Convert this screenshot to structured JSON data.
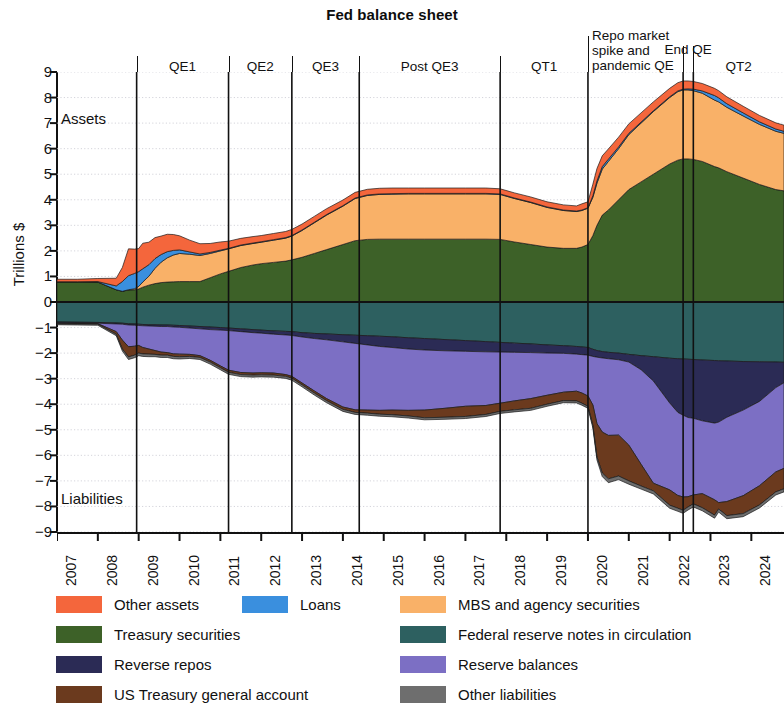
{
  "chart_data": {
    "type": "area",
    "title": "Fed balance sheet",
    "xlabel": "",
    "ylabel": "Trillions $",
    "ylim": [
      -9,
      9
    ],
    "xlim": [
      2007,
      2024.8
    ],
    "grid": true,
    "legend_position": "bottom",
    "y_ticks": [
      "9",
      "8",
      "7",
      "6",
      "5",
      "4",
      "3",
      "2",
      "1",
      "0",
      "−1",
      "−2",
      "−3",
      "−4",
      "−5",
      "−6",
      "−7",
      "−8",
      "−9"
    ],
    "x_ticks": [
      "2007",
      "2008",
      "2009",
      "2010",
      "2011",
      "2012",
      "2013",
      "2014",
      "2015",
      "2016",
      "2017",
      "2018",
      "2019",
      "2020",
      "2021",
      "2022",
      "2023",
      "2024"
    ],
    "side_labels": {
      "assets": "Assets",
      "liabilities": "Liabilities"
    },
    "period_bands": [
      {
        "label": "QE1",
        "start": 2008.95,
        "end": 2011.2
      },
      {
        "label": "QE2",
        "start": 2011.2,
        "end": 2012.75
      },
      {
        "label": "QE3",
        "start": 2012.75,
        "end": 2014.4
      },
      {
        "label": "Post QE3",
        "start": 2014.4,
        "end": 2017.85
      },
      {
        "label": "QT1",
        "start": 2017.85,
        "end": 2020.0
      },
      {
        "label": "Repo market spike and pandemic QE",
        "start": 2020.0,
        "end": 2022.33
      },
      {
        "label": "End QE",
        "start": 2022.33,
        "end": 2022.58
      },
      {
        "label": "QT2",
        "start": 2022.58,
        "end": 2024.8
      }
    ],
    "divider_years": [
      2008.95,
      2011.2,
      2012.75,
      2014.4,
      2017.85,
      2020.0,
      2022.33,
      2022.58
    ],
    "x": [
      2007.0,
      2007.5,
      2008.0,
      2008.45,
      2008.6,
      2008.75,
      2008.9,
      2009.0,
      2009.1,
      2009.25,
      2009.4,
      2009.55,
      2009.7,
      2009.85,
      2010.0,
      2010.25,
      2010.5,
      2010.75,
      2011.0,
      2011.2,
      2011.5,
      2011.8,
      2012.0,
      2012.3,
      2012.6,
      2012.75,
      2013.0,
      2013.3,
      2013.6,
      2014.0,
      2014.3,
      2014.6,
      2014.9,
      2015.2,
      2015.6,
      2016.0,
      2016.5,
      2017.0,
      2017.5,
      2017.85,
      2018.2,
      2018.6,
      2019.0,
      2019.4,
      2019.72,
      2019.85,
      2020.0,
      2020.12,
      2020.22,
      2020.35,
      2020.5,
      2020.75,
      2021.0,
      2021.3,
      2021.6,
      2022.0,
      2022.2,
      2022.33,
      2022.45,
      2022.58,
      2022.8,
      2023.1,
      2023.2,
      2023.4,
      2023.8,
      2024.2,
      2024.6,
      2024.8
    ],
    "assets_series": [
      {
        "name": "Treasury securities",
        "color": "#3D6128",
        "values": [
          0.79,
          0.79,
          0.78,
          0.48,
          0.42,
          0.47,
          0.48,
          0.51,
          0.58,
          0.66,
          0.72,
          0.76,
          0.78,
          0.79,
          0.8,
          0.8,
          0.8,
          0.95,
          1.1,
          1.2,
          1.35,
          1.45,
          1.5,
          1.55,
          1.6,
          1.65,
          1.75,
          1.9,
          2.05,
          2.25,
          2.4,
          2.45,
          2.46,
          2.46,
          2.46,
          2.46,
          2.46,
          2.46,
          2.46,
          2.45,
          2.35,
          2.25,
          2.15,
          2.1,
          2.1,
          2.15,
          2.25,
          2.6,
          3.0,
          3.4,
          3.6,
          4.0,
          4.4,
          4.7,
          5.0,
          5.4,
          5.55,
          5.6,
          5.6,
          5.58,
          5.5,
          5.3,
          5.25,
          5.1,
          4.85,
          4.6,
          4.4,
          4.35
        ]
      },
      {
        "name": "MBS and agency securities",
        "color": "#F9B168",
        "values": [
          0.0,
          0.0,
          0.0,
          0.0,
          0.0,
          0.01,
          0.04,
          0.1,
          0.2,
          0.35,
          0.6,
          0.8,
          0.95,
          1.05,
          1.1,
          1.07,
          1.02,
          0.95,
          0.9,
          0.88,
          0.86,
          0.84,
          0.84,
          0.87,
          0.9,
          0.93,
          1.05,
          1.2,
          1.35,
          1.5,
          1.65,
          1.72,
          1.75,
          1.76,
          1.77,
          1.77,
          1.77,
          1.77,
          1.77,
          1.76,
          1.7,
          1.64,
          1.55,
          1.48,
          1.44,
          1.43,
          1.42,
          1.5,
          1.65,
          1.8,
          1.9,
          2.0,
          2.15,
          2.3,
          2.45,
          2.6,
          2.68,
          2.7,
          2.7,
          2.69,
          2.67,
          2.6,
          2.58,
          2.52,
          2.43,
          2.35,
          2.28,
          2.25
        ]
      },
      {
        "name": "Loans",
        "color": "#3A8FDE",
        "values": [
          0.0,
          0.0,
          0.02,
          0.15,
          0.38,
          0.55,
          0.6,
          0.58,
          0.52,
          0.45,
          0.38,
          0.3,
          0.24,
          0.18,
          0.14,
          0.09,
          0.06,
          0.04,
          0.03,
          0.02,
          0.02,
          0.02,
          0.02,
          0.02,
          0.02,
          0.02,
          0.02,
          0.02,
          0.02,
          0.02,
          0.02,
          0.02,
          0.02,
          0.02,
          0.02,
          0.02,
          0.02,
          0.02,
          0.02,
          0.02,
          0.02,
          0.02,
          0.02,
          0.02,
          0.02,
          0.02,
          0.02,
          0.06,
          0.09,
          0.1,
          0.09,
          0.07,
          0.05,
          0.04,
          0.03,
          0.03,
          0.03,
          0.03,
          0.04,
          0.06,
          0.09,
          0.18,
          0.16,
          0.14,
          0.12,
          0.1,
          0.09,
          0.08
        ]
      },
      {
        "name": "Other assets",
        "color": "#F4663C",
        "values": [
          0.1,
          0.1,
          0.12,
          0.3,
          0.55,
          1.05,
          0.95,
          0.9,
          1.0,
          0.88,
          0.82,
          0.72,
          0.68,
          0.62,
          0.55,
          0.46,
          0.4,
          0.35,
          0.32,
          0.28,
          0.26,
          0.25,
          0.24,
          0.24,
          0.24,
          0.24,
          0.23,
          0.23,
          0.23,
          0.22,
          0.22,
          0.22,
          0.22,
          0.22,
          0.21,
          0.21,
          0.21,
          0.21,
          0.21,
          0.2,
          0.2,
          0.2,
          0.2,
          0.2,
          0.2,
          0.24,
          0.23,
          0.45,
          0.48,
          0.42,
          0.4,
          0.38,
          0.37,
          0.36,
          0.35,
          0.33,
          0.32,
          0.32,
          0.31,
          0.3,
          0.29,
          0.28,
          0.28,
          0.27,
          0.26,
          0.25,
          0.24,
          0.24
        ]
      }
    ],
    "liabilities_series": [
      {
        "name": "Federal reserve notes in circulation",
        "color": "#2D6060",
        "values": [
          0.78,
          0.79,
          0.8,
          0.82,
          0.83,
          0.85,
          0.86,
          0.87,
          0.88,
          0.89,
          0.89,
          0.9,
          0.9,
          0.91,
          0.92,
          0.94,
          0.96,
          0.98,
          1.0,
          1.02,
          1.05,
          1.08,
          1.1,
          1.13,
          1.15,
          1.16,
          1.2,
          1.23,
          1.25,
          1.28,
          1.3,
          1.32,
          1.34,
          1.36,
          1.4,
          1.43,
          1.47,
          1.51,
          1.55,
          1.58,
          1.61,
          1.64,
          1.68,
          1.71,
          1.74,
          1.76,
          1.78,
          1.85,
          1.9,
          1.94,
          1.97,
          2.0,
          2.05,
          2.1,
          2.14,
          2.2,
          2.22,
          2.23,
          2.24,
          2.25,
          2.27,
          2.29,
          2.3,
          2.31,
          2.33,
          2.34,
          2.35,
          2.36
        ]
      },
      {
        "name": "Reverse repos",
        "color": "#2B2B55",
        "values": [
          0.03,
          0.03,
          0.03,
          0.04,
          0.04,
          0.05,
          0.05,
          0.05,
          0.05,
          0.05,
          0.06,
          0.06,
          0.06,
          0.07,
          0.07,
          0.08,
          0.09,
          0.1,
          0.1,
          0.1,
          0.11,
          0.12,
          0.12,
          0.13,
          0.14,
          0.15,
          0.17,
          0.2,
          0.23,
          0.28,
          0.32,
          0.36,
          0.4,
          0.42,
          0.44,
          0.45,
          0.44,
          0.42,
          0.4,
          0.38,
          0.36,
          0.34,
          0.32,
          0.3,
          0.3,
          0.3,
          0.3,
          0.28,
          0.26,
          0.25,
          0.25,
          0.26,
          0.3,
          0.55,
          0.95,
          1.75,
          2.1,
          2.2,
          2.28,
          2.3,
          2.38,
          2.45,
          2.4,
          2.2,
          1.9,
          1.55,
          1.0,
          0.8
        ]
      },
      {
        "name": "Reserve balances",
        "color": "#7C6FC4",
        "values": [
          0.02,
          0.02,
          0.02,
          0.3,
          0.62,
          0.85,
          0.82,
          0.78,
          0.85,
          0.9,
          0.95,
          1.0,
          1.02,
          1.05,
          1.05,
          1.03,
          1.05,
          1.2,
          1.4,
          1.55,
          1.6,
          1.58,
          1.55,
          1.52,
          1.55,
          1.6,
          1.8,
          2.05,
          2.3,
          2.55,
          2.6,
          2.55,
          2.5,
          2.45,
          2.4,
          2.35,
          2.25,
          2.15,
          2.1,
          2.0,
          1.9,
          1.8,
          1.65,
          1.52,
          1.45,
          1.5,
          1.6,
          1.9,
          2.6,
          2.9,
          3.0,
          2.95,
          3.25,
          3.7,
          4.0,
          3.4,
          3.25,
          3.2,
          3.1,
          3.0,
          2.85,
          3.0,
          3.15,
          3.3,
          3.35,
          3.3,
          3.3,
          3.35
        ]
      },
      {
        "name": "US Treasury general account",
        "color": "#6B3A1E",
        "values": [
          0.02,
          0.02,
          0.02,
          0.1,
          0.35,
          0.4,
          0.35,
          0.3,
          0.25,
          0.2,
          0.15,
          0.12,
          0.1,
          0.1,
          0.1,
          0.08,
          0.07,
          0.07,
          0.07,
          0.08,
          0.08,
          0.08,
          0.08,
          0.08,
          0.07,
          0.07,
          0.07,
          0.08,
          0.08,
          0.09,
          0.1,
          0.12,
          0.15,
          0.18,
          0.22,
          0.3,
          0.35,
          0.4,
          0.35,
          0.32,
          0.35,
          0.38,
          0.35,
          0.33,
          0.38,
          0.4,
          0.4,
          0.8,
          1.3,
          1.6,
          1.7,
          1.6,
          1.4,
          0.85,
          0.3,
          0.6,
          0.5,
          0.52,
          0.4,
          0.35,
          0.55,
          0.6,
          0.25,
          0.55,
          0.7,
          0.75,
          0.78,
          0.8
        ]
      },
      {
        "name": "Other liabilities",
        "color": "#6E6E6E",
        "values": [
          0.04,
          0.04,
          0.04,
          0.06,
          0.08,
          0.1,
          0.1,
          0.1,
          0.1,
          0.1,
          0.09,
          0.09,
          0.09,
          0.09,
          0.09,
          0.08,
          0.08,
          0.08,
          0.08,
          0.08,
          0.08,
          0.08,
          0.08,
          0.08,
          0.08,
          0.08,
          0.08,
          0.08,
          0.08,
          0.08,
          0.08,
          0.08,
          0.08,
          0.08,
          0.08,
          0.08,
          0.08,
          0.08,
          0.08,
          0.08,
          0.08,
          0.08,
          0.08,
          0.08,
          0.08,
          0.08,
          0.08,
          0.1,
          0.12,
          0.14,
          0.15,
          0.14,
          0.13,
          0.12,
          0.12,
          0.12,
          0.12,
          0.12,
          0.12,
          0.12,
          0.12,
          0.12,
          0.12,
          0.12,
          0.12,
          0.12,
          0.12,
          0.12
        ]
      }
    ]
  },
  "legend": {
    "items": [
      {
        "label": "Other assets",
        "color": "#F4663C",
        "col": 0,
        "row": 0
      },
      {
        "label": "Loans",
        "color": "#3A8FDE",
        "col": 1,
        "row": 0
      },
      {
        "label": "MBS and agency securities",
        "color": "#F9B168",
        "col": 2,
        "row": 0
      },
      {
        "label": "Treasury securities",
        "color": "#3D6128",
        "col": 0,
        "row": 1
      },
      {
        "label": "Federal reserve notes in circulation",
        "color": "#2D6060",
        "col": 2,
        "row": 1
      },
      {
        "label": "Reverse repos",
        "color": "#2B2B55",
        "col": 0,
        "row": 2
      },
      {
        "label": "Reserve balances",
        "color": "#7C6FC4",
        "col": 2,
        "row": 2
      },
      {
        "label": "US Treasury general account",
        "color": "#6B3A1E",
        "col": 0,
        "row": 3
      },
      {
        "label": "Other liabilities",
        "color": "#6E6E6E",
        "col": 2,
        "row": 3
      }
    ]
  }
}
